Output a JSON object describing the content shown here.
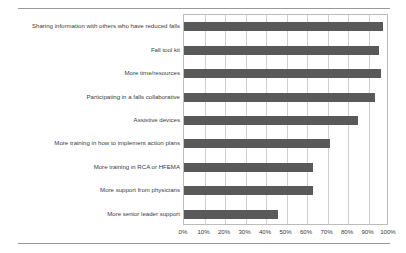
{
  "chart_data": {
    "type": "bar",
    "orientation": "horizontal",
    "title": "",
    "subtitle": "",
    "xlabel": "",
    "ylabel": "",
    "xlim": [
      0,
      100
    ],
    "xtick_values": [
      0,
      10,
      20,
      30,
      40,
      50,
      60,
      70,
      80,
      90,
      100
    ],
    "xtick_labels": [
      "0%",
      "10%",
      "20%",
      "30%",
      "40%",
      "50%",
      "60%",
      "70%",
      "80%",
      "90%",
      "100%"
    ],
    "grid": true,
    "grid_axis": "x",
    "legend": false,
    "legend_position": "none",
    "bar_color": "#595959",
    "categories": [
      "Sharing information with others who have reduced falls",
      "Fall tool kit",
      "More time/resources",
      "Participating in a falls collaborative",
      "Assistive devices",
      "More training in how to implement action plans",
      "More training in RCA or HFEMA",
      "More support from physicians",
      "More senior leader support"
    ],
    "values": [
      97,
      95,
      96,
      93,
      85,
      71,
      63,
      63,
      46
    ],
    "series": [
      {
        "name": "",
        "values": [
          97,
          95,
          96,
          93,
          85,
          71,
          63,
          63,
          46
        ]
      }
    ]
  },
  "colors": {
    "bar": "#595959",
    "gridline": "#cfcfcf",
    "frame": "#bdbdbd",
    "rule": "#9a9a9a",
    "text": "#3c3c3c",
    "background": "#ffffff"
  }
}
